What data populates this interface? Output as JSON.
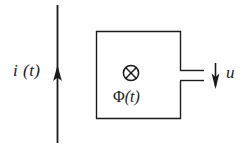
{
  "figure": {
    "background_color": "#ffffff",
    "stroke_color": "#1a1a1a",
    "labels": {
      "current": "i (t)",
      "flux_symbol": "Φ",
      "flux_argument": "(t)",
      "voltage": "u",
      "flux_direction_icon": "⊗"
    },
    "elements": {
      "conductor_line": {
        "name": "vertical current-carrying conductor",
        "x": 57,
        "y_top": 5,
        "y_bottom": 143
      },
      "current_arrow": {
        "name": "upward current direction arrow",
        "direction": "up",
        "tip_y": 66,
        "base_y": 81
      },
      "loop_rectangle": {
        "name": "induction loop",
        "left": 96,
        "top": 31,
        "right": 181,
        "bottom": 119
      },
      "terminal_gap": {
        "name": "open terminals on right side of loop",
        "upper_stub_y": 70,
        "lower_stub_y": 81,
        "stub_end_x": 204
      },
      "flux_marker": {
        "name": "flux into page symbol",
        "center_x": 131,
        "center_y": 73,
        "radius": 8
      },
      "voltage_arrow": {
        "name": "downward induced voltage arrow",
        "direction": "down",
        "x": 215,
        "y_top": 63,
        "y_bottom": 88
      }
    }
  }
}
